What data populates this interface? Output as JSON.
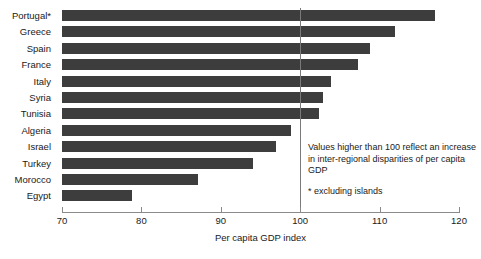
{
  "chart_data": {
    "type": "bar",
    "orientation": "horizontal",
    "title": "",
    "xlabel": "Per capita GDP index",
    "ylabel": "",
    "xlim": [
      70,
      120
    ],
    "xticks": [
      70,
      80,
      90,
      100,
      110,
      120
    ],
    "grid": false,
    "legend": null,
    "reference_line": {
      "value": 100,
      "style": "solid-thin"
    },
    "bar_color": "#3d3d3d",
    "categories": [
      "Portugal*",
      "Greece",
      "Spain",
      "France",
      "Italy",
      "Syria",
      "Tunisia",
      "Algeria",
      "Israel",
      "Turkey",
      "Morocco",
      "Egypt"
    ],
    "values": [
      117.0,
      112.0,
      108.8,
      107.3,
      103.9,
      102.9,
      102.4,
      98.9,
      97.0,
      94.0,
      87.1,
      78.8
    ],
    "annotations": [
      "Values higher than 100 reflect an increase in inter-regional disparities of per capita GDP",
      "* excluding islands"
    ]
  },
  "annotation": {
    "note": "Values higher than 100 reflect an increase in inter-regional disparities of per capita GDP",
    "footnote": "* excluding islands"
  }
}
